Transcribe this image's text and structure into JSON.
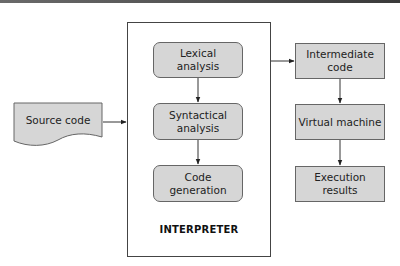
{
  "diagram": {
    "container": {
      "label": "INTERPRETER"
    },
    "nodes": [
      {
        "id": "source",
        "label": "Source code",
        "shape": "document"
      },
      {
        "id": "lexical",
        "label": "Lexical\nanalysis",
        "shape": "rounded-rect"
      },
      {
        "id": "syntactical",
        "label": "Syntactical\nanalysis",
        "shape": "rounded-rect"
      },
      {
        "id": "codegen",
        "label": "Code\ngeneration",
        "shape": "rounded-rect"
      },
      {
        "id": "intermediate",
        "label": "Intermediate\ncode",
        "shape": "rect"
      },
      {
        "id": "vm",
        "label": "Virtual machine",
        "shape": "rect"
      },
      {
        "id": "results",
        "label": "Execution\nresults",
        "shape": "rect"
      }
    ],
    "edges": [
      {
        "from": "source",
        "to": "interpreter"
      },
      {
        "from": "lexical",
        "to": "syntactical"
      },
      {
        "from": "syntactical",
        "to": "codegen"
      },
      {
        "from": "interpreter",
        "to": "intermediate"
      },
      {
        "from": "intermediate",
        "to": "vm"
      },
      {
        "from": "vm",
        "to": "results"
      }
    ],
    "colors": {
      "box_fill": "#d6d6d6",
      "stroke": "#444444",
      "background": "#ffffff"
    }
  }
}
